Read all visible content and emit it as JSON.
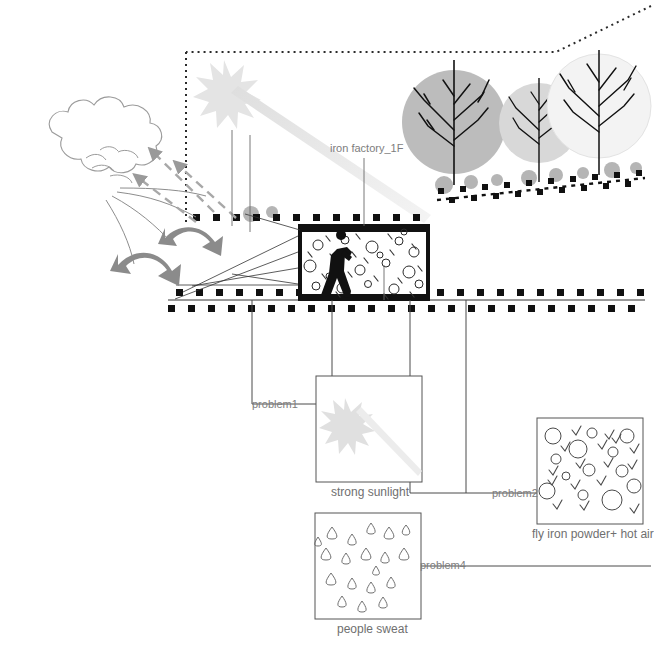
{
  "diagram": {
    "title_label": "iron factory_1F",
    "annotations": [
      {
        "id": "problem1",
        "label": "problem1",
        "x": 252,
        "y": 398
      },
      {
        "id": "problem2",
        "label": "problem2",
        "x": 492,
        "y": 487
      },
      {
        "id": "problem4",
        "label": "problem4",
        "x": 420,
        "y": 559
      }
    ],
    "panels": [
      {
        "id": "strong-sunlight",
        "caption": "strong sunlight",
        "x": 316,
        "y": 376,
        "w": 106,
        "h": 106,
        "caption_x": 331,
        "caption_y": 485
      },
      {
        "id": "fly-iron-powder",
        "caption": "fly iron powder+ hot air",
        "x": 537,
        "y": 418,
        "w": 106,
        "h": 106,
        "caption_x": 532,
        "caption_y": 527
      },
      {
        "id": "people-sweat",
        "caption": "people sweat",
        "x": 315,
        "y": 513,
        "w": 106,
        "h": 106,
        "caption_x": 337,
        "caption_y": 622
      }
    ],
    "scene": {
      "building_label": "iron factory interior",
      "worker": "worker-silhouette",
      "trees": [
        "tree-large",
        "tree-medium",
        "tree-small"
      ],
      "wind": "wind-cloud",
      "sun": "sun-burst"
    },
    "colors": {
      "ink": "#1a1a1a",
      "text": "#7d7d7d",
      "arrow_gray": "#8b8b8b",
      "canopy_1": "#b9b9b9",
      "canopy_2": "#d6d6d6",
      "canopy_3": "#f2f2f2",
      "line": "#4a4a4a",
      "sun": "#e2e2e2"
    }
  }
}
